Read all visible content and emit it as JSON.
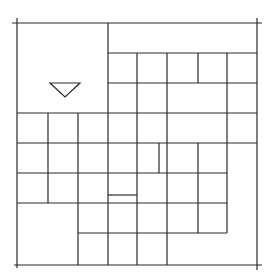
{
  "diagram": {
    "type": "floor-plan-grid",
    "stroke_color": "#2b2b2b",
    "background": "#ffffff",
    "frame": {
      "x1": 17,
      "y1": 23,
      "x2": 257,
      "y2": 265
    },
    "horizontal_lines": [
      {
        "y": 23,
        "x1": 12,
        "x2": 262
      },
      {
        "y": 53,
        "x1": 108,
        "x2": 257
      },
      {
        "y": 83,
        "x1": 108,
        "x2": 257
      },
      {
        "y": 113,
        "x1": 17,
        "x2": 257
      },
      {
        "y": 143,
        "x1": 17,
        "x2": 257
      },
      {
        "y": 173,
        "x1": 17,
        "x2": 227
      },
      {
        "y": 195,
        "x1": 108,
        "x2": 137
      },
      {
        "y": 203,
        "x1": 17,
        "x2": 227
      },
      {
        "y": 233,
        "x1": 78,
        "x2": 227
      },
      {
        "y": 265,
        "x1": 14,
        "x2": 262
      }
    ],
    "vertical_lines": [
      {
        "x": 17,
        "y1": 18,
        "y2": 268
      },
      {
        "x": 48,
        "y1": 113,
        "y2": 203
      },
      {
        "x": 78,
        "y1": 113,
        "y2": 265
      },
      {
        "x": 108,
        "y1": 23,
        "y2": 265
      },
      {
        "x": 137,
        "y1": 53,
        "y2": 265
      },
      {
        "x": 159,
        "y1": 143,
        "y2": 173
      },
      {
        "x": 167,
        "y1": 53,
        "y2": 265
      },
      {
        "x": 198,
        "y1": 53,
        "y2": 83
      },
      {
        "x": 198,
        "y1": 143,
        "y2": 233
      },
      {
        "x": 227,
        "y1": 53,
        "y2": 233
      },
      {
        "x": 257,
        "y1": 18,
        "y2": 270
      }
    ],
    "marker": {
      "shape": "inverted-triangle",
      "points": "50,83 80,83 65,97"
    }
  }
}
